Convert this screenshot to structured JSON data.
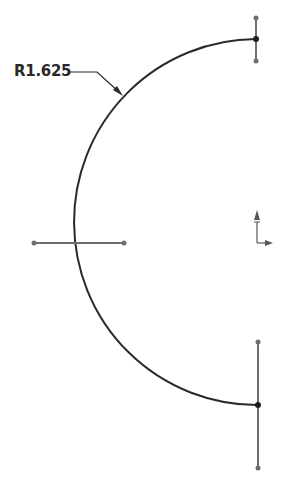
{
  "drawing": {
    "type": "sketch",
    "dimension": {
      "label": "R1.625",
      "kind": "radius"
    },
    "arc": {
      "start": [
        256,
        39
      ],
      "end": [
        258,
        405
      ],
      "radius_px": 183,
      "direction": "counterclockwise-left"
    },
    "construction_lines": [
      {
        "name": "top-vertical",
        "from": [
          256,
          17
        ],
        "to": [
          256,
          61
        ]
      },
      {
        "name": "middle-horizontal",
        "from": [
          34,
          243
        ],
        "to": [
          124,
          243
        ]
      },
      {
        "name": "bottom-vertical",
        "from": [
          258,
          342
        ],
        "to": [
          258,
          468
        ]
      }
    ],
    "origin_marker": {
      "position": [
        257,
        241
      ]
    },
    "colors": {
      "line": "#2a2a2a",
      "construction": "#6e6e6e",
      "background": "#ffffff"
    }
  }
}
